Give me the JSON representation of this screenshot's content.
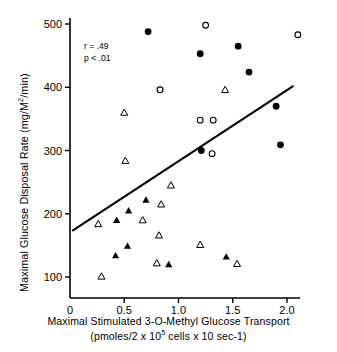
{
  "chart_data": {
    "type": "scatter",
    "title": "",
    "xlabel": "Maximal Stimulated 3-O-Methyl Glucose Transport",
    "xlabel_line2_prefix": "(pmoles/2 x 10",
    "xlabel_line2_sup": "5",
    "xlabel_line2_suffix": " cells x 10 sec-1)",
    "ylabel_prefix": "Maximal Glucose Disposal Rate (mg/M",
    "ylabel_sup": "2",
    "ylabel_suffix": "/min)",
    "xlim": [
      0.0,
      2.15
    ],
    "ylim": [
      85,
      510
    ],
    "xticks": [
      0,
      0.5,
      1.0,
      1.5,
      2.0
    ],
    "xticklabels": [
      "0",
      "0.5",
      "1.0",
      "1.5",
      "2.0"
    ],
    "yticks": [
      100,
      200,
      300,
      400,
      500
    ],
    "yticklabels": [
      "100",
      "200",
      "300",
      "400",
      "500"
    ],
    "grid": false,
    "legend": "none",
    "annotations": [
      {
        "text": "r = .49",
        "x": 0.14,
        "y": 462
      },
      {
        "text": "p < .01",
        "x": 0.14,
        "y": 443
      }
    ],
    "regression_line": {
      "x_start": 0.02,
      "y_start": 173,
      "x_end": 2.06,
      "y_end": 402
    },
    "series": [
      {
        "name": "filled-circle",
        "marker": "filled-circle",
        "points": [
          {
            "x": 0.72,
            "y": 488
          },
          {
            "x": 1.2,
            "y": 453
          },
          {
            "x": 1.55,
            "y": 465
          },
          {
            "x": 1.65,
            "y": 424
          },
          {
            "x": 1.9,
            "y": 370
          },
          {
            "x": 1.94,
            "y": 309
          },
          {
            "x": 1.21,
            "y": 300
          }
        ]
      },
      {
        "name": "open-circle",
        "marker": "open-circle",
        "points": [
          {
            "x": 1.25,
            "y": 498
          },
          {
            "x": 2.1,
            "y": 483
          },
          {
            "x": 0.83,
            "y": 396
          },
          {
            "x": 1.2,
            "y": 348
          },
          {
            "x": 1.32,
            "y": 348
          },
          {
            "x": 1.31,
            "y": 295
          }
        ]
      },
      {
        "name": "filled-triangle",
        "marker": "filled-triangle",
        "points": [
          {
            "x": 0.43,
            "y": 190
          },
          {
            "x": 0.54,
            "y": 205
          },
          {
            "x": 0.7,
            "y": 222
          },
          {
            "x": 0.42,
            "y": 134
          },
          {
            "x": 0.53,
            "y": 149
          },
          {
            "x": 0.91,
            "y": 120
          },
          {
            "x": 1.44,
            "y": 132
          }
        ]
      },
      {
        "name": "open-triangle",
        "marker": "open-triangle",
        "points": [
          {
            "x": 0.5,
            "y": 360
          },
          {
            "x": 1.43,
            "y": 396
          },
          {
            "x": 0.51,
            "y": 284
          },
          {
            "x": 0.93,
            "y": 245
          },
          {
            "x": 0.84,
            "y": 215
          },
          {
            "x": 0.67,
            "y": 190
          },
          {
            "x": 0.26,
            "y": 184
          },
          {
            "x": 0.82,
            "y": 166
          },
          {
            "x": 1.2,
            "y": 151
          },
          {
            "x": 0.8,
            "y": 122
          },
          {
            "x": 1.54,
            "y": 121
          },
          {
            "x": 0.29,
            "y": 101
          }
        ]
      }
    ]
  }
}
